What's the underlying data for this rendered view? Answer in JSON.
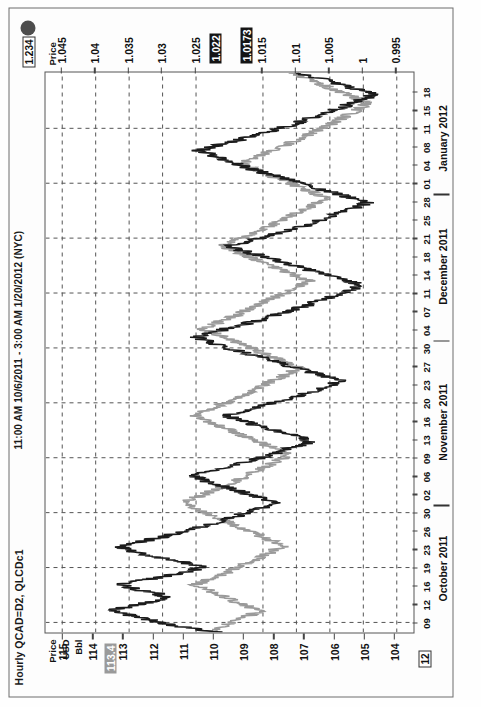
{
  "chart_data": {
    "type": "line",
    "title": "Hourly QCAD=D2, QLCDc1",
    "subtitle": "11:00 AM 10/6/2011 - 3:00 AM 1/20/2012 (NYC)",
    "xlabel": "",
    "grid": true,
    "legend_position": "none",
    "x_tick_labels": [
      "09",
      "12",
      "16",
      "19",
      "23",
      "26",
      "30",
      "02",
      "06",
      "09",
      "13",
      "16",
      "20",
      "23",
      "27",
      "30",
      "04",
      "07",
      "11",
      "14",
      "18",
      "21",
      "25",
      "28",
      "01",
      "04",
      "08",
      "11",
      "15",
      "18"
    ],
    "x_month_labels": [
      "October 2011",
      "November 2011",
      "December 2011",
      "January 2012"
    ],
    "axes": [
      {
        "id": "left",
        "position": "left",
        "header_lines": [
          "Price",
          "USD",
          "Bbl"
        ],
        "tick_labels": [
          "104",
          "105",
          "106",
          "107",
          "108",
          "109",
          "110",
          "111",
          "112",
          "113",
          "114",
          "115"
        ],
        "ylim": [
          103.4,
          115.6
        ],
        "highlight_value": "113.4",
        "corner_tag": "12"
      },
      {
        "id": "right",
        "position": "right",
        "header_lines": [
          "Price"
        ],
        "tick_labels": [
          "1.045",
          "1.04",
          "1.035",
          "1.03",
          "1.025",
          "1.015",
          "1.01",
          "1.005",
          "1",
          "0.995"
        ],
        "ylim": [
          0.9925,
          1.0475
        ],
        "highlight_values": [
          "1.022",
          "1.0173"
        ],
        "corner_tag": "1.234"
      }
    ],
    "series": [
      {
        "name": "QLCDc1",
        "color": "#1b1b1b",
        "axis": "left",
        "values": [
          109.9,
          110.8,
          111.7,
          112.2,
          112.8,
          113.4,
          112.9,
          112.1,
          111.5,
          111.9,
          112.6,
          113.1,
          112.4,
          111.6,
          110.9,
          110.4,
          110.9,
          111.6,
          112.3,
          112.9,
          113.1,
          112.4,
          111.7,
          111.2,
          110.6,
          110.1,
          109.7,
          109.2,
          108.8,
          108.3,
          107.9,
          108.4,
          108.9,
          109.4,
          109.9,
          110.3,
          110.7,
          110.2,
          109.6,
          109.1,
          108.6,
          108.1,
          107.7,
          107.2,
          106.8,
          107.2,
          107.7,
          108.2,
          108.7,
          109.2,
          109.6,
          109.1,
          108.5,
          108.0,
          107.5,
          107.0,
          106.6,
          106.2,
          105.8,
          106.3,
          106.8,
          107.3,
          107.8,
          108.3,
          108.8,
          109.3,
          109.8,
          110.2,
          110.6,
          110.1,
          109.6,
          109.0,
          108.5,
          108.0,
          107.6,
          107.1,
          106.7,
          106.3,
          105.9,
          105.5,
          105.1,
          105.6,
          106.1,
          106.6,
          107.1,
          107.6,
          108.1,
          108.6,
          109.1,
          109.5,
          109.0,
          108.4,
          107.9,
          107.4,
          106.9,
          106.5,
          106.1,
          105.7,
          105.3,
          104.9,
          105.4,
          105.9,
          106.4,
          106.9,
          107.4,
          107.9,
          108.4,
          108.9,
          109.3,
          109.7,
          110.1,
          110.5,
          110.0,
          109.4,
          108.9,
          108.4,
          107.9,
          107.4,
          107.0,
          106.6,
          106.2,
          105.8,
          105.4,
          105.0,
          104.7,
          105.2,
          105.7,
          106.2,
          106.7,
          107.2
        ],
        "note": "Crude oil, USD/Bbl, plotted against the left axis"
      },
      {
        "name": "QCAD=D2",
        "color": "#9a9a9a",
        "axis": "right",
        "values": [
          1.023,
          1.0215,
          1.02,
          1.0185,
          1.017,
          1.0155,
          1.0172,
          1.019,
          1.0205,
          1.022,
          1.0235,
          1.025,
          1.0235,
          1.0218,
          1.0202,
          1.0188,
          1.0175,
          1.016,
          1.0146,
          1.0132,
          1.012,
          1.0135,
          1.015,
          1.0165,
          1.018,
          1.0196,
          1.021,
          1.0225,
          1.024,
          1.0255,
          1.0268,
          1.0252,
          1.0236,
          1.022,
          1.0205,
          1.019,
          1.0176,
          1.0162,
          1.0148,
          1.0135,
          1.0122,
          1.011,
          1.0126,
          1.0142,
          1.0158,
          1.0174,
          1.019,
          1.0206,
          1.0222,
          1.0238,
          1.0252,
          1.0236,
          1.022,
          1.0204,
          1.019,
          1.0176,
          1.0162,
          1.0148,
          1.0134,
          1.012,
          1.0108,
          1.0096,
          1.0112,
          1.0128,
          1.0144,
          1.016,
          1.0176,
          1.0192,
          1.0208,
          1.0224,
          1.024,
          1.0224,
          1.0208,
          1.0192,
          1.0178,
          1.0164,
          1.015,
          1.0136,
          1.0122,
          1.0108,
          1.0094,
          1.0082,
          1.0098,
          1.0114,
          1.013,
          1.0146,
          1.0162,
          1.0178,
          1.0194,
          1.021,
          1.0196,
          1.018,
          1.0164,
          1.015,
          1.0136,
          1.0122,
          1.0108,
          1.0094,
          1.008,
          1.0068,
          1.0056,
          1.007,
          1.0086,
          1.0102,
          1.0118,
          1.0134,
          1.015,
          1.0166,
          1.0182,
          1.0168,
          1.0152,
          1.0136,
          1.012,
          1.0106,
          1.0092,
          1.0078,
          1.0064,
          1.005,
          1.0038,
          1.0026,
          1.0014,
          1.0002,
          0.9996,
          1.001,
          1.0026,
          1.0042,
          1.0058,
          1.0074,
          1.009,
          1.0106
        ],
        "note": "Canadian dollar rate, plotted against the right axis"
      }
    ]
  },
  "header": {
    "title": "Hourly QCAD=D2, QLCDc1",
    "subtitle": "11:00 AM 10/6/2011 - 3:00 AM 1/20/2012 (NYC)"
  },
  "left_axis": {
    "header": [
      "Price",
      "USD",
      "Bbl"
    ],
    "ticks": [
      "104",
      "105",
      "106",
      "107",
      "108",
      "109",
      "110",
      "111",
      "112",
      "113",
      "114",
      "115"
    ],
    "highlight": "113.4",
    "tag": "12"
  },
  "right_axis": {
    "header": [
      "Price"
    ],
    "ticks": [
      "1.045",
      "1.04",
      "1.035",
      "1.03",
      "1.025",
      "1.015",
      "1.01",
      "1.005",
      "1",
      "0.995"
    ],
    "highlight_a": "1.022",
    "highlight_b": "1.0173",
    "tag": "1.234"
  },
  "time_axis": {
    "days": [
      "09",
      "12",
      "16",
      "19",
      "23",
      "26",
      "30",
      "02",
      "06",
      "09",
      "13",
      "16",
      "20",
      "23",
      "27",
      "30",
      "04",
      "07",
      "11",
      "14",
      "18",
      "21",
      "25",
      "28",
      "01",
      "04",
      "08",
      "11",
      "15",
      "18"
    ],
    "months": [
      "October 2011",
      "November 2011",
      "December 2011",
      "January 2012"
    ]
  }
}
